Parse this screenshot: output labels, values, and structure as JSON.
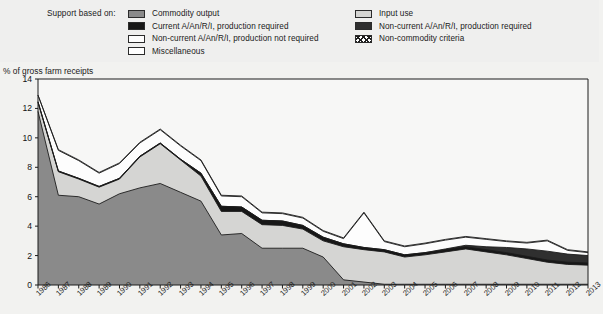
{
  "legend": {
    "title": "Support based on:",
    "items": [
      {
        "label": "Commodity output",
        "swatch": "sw-commodity",
        "icon": "legend-swatch-commodity-output",
        "col": 0,
        "row": 0
      },
      {
        "label": "Current A/An/R/I, production required",
        "swatch": "sw-current-anri",
        "icon": "legend-swatch-current-anri",
        "col": 0,
        "row": 1
      },
      {
        "label": "Non-current A/An/R/I, production not required",
        "swatch": "sw-noncurrent-notreq",
        "icon": "legend-swatch-noncurrent-not-required",
        "col": 0,
        "row": 2
      },
      {
        "label": "Miscellaneous",
        "swatch": "sw-misc",
        "icon": "legend-swatch-miscellaneous",
        "col": 0,
        "row": 3
      },
      {
        "label": "Input use",
        "swatch": "sw-inputuse",
        "icon": "legend-swatch-input-use",
        "col": 1,
        "row": 0
      },
      {
        "label": "Non-current A/An/R/I, production required",
        "swatch": "sw-noncurrent-req",
        "icon": "legend-swatch-noncurrent-required",
        "col": 1,
        "row": 1
      },
      {
        "label": "Non-commodity criteria",
        "swatch": "sw-noncommodity",
        "icon": "legend-swatch-non-commodity-criteria",
        "col": 1,
        "row": 2
      }
    ]
  },
  "axis": {
    "y_title": "% of gross farm receipts",
    "y_ticks": [
      "0",
      "2",
      "4",
      "6",
      "8",
      "10",
      "12",
      "14"
    ]
  },
  "colors": {
    "commodity_output": "#8a8a8a",
    "input_use": "#d5d5d3",
    "current_anri": "#171717",
    "noncurrent_required": "#2f2f2f",
    "noncurrent_not_required": "#fdfdfd",
    "miscellaneous": "#ffffff",
    "non_commodity": "#ffffff",
    "outline": "#1c1c1c",
    "plot_background": "#f7f7f6",
    "page_background": "#f2f2f0"
  },
  "chart_data": {
    "type": "area",
    "stacked": true,
    "title": "",
    "xlabel": "",
    "ylabel": "% of gross farm receipts",
    "ylim": [
      0,
      14
    ],
    "ytick_step": 2,
    "grid": false,
    "legend_position": "top",
    "categories": [
      "1986",
      "1987",
      "1988",
      "1989",
      "1990",
      "1991",
      "1992",
      "1993",
      "1994",
      "1995",
      "1996",
      "1997",
      "1998",
      "1999",
      "2000",
      "2001",
      "2002",
      "2003",
      "2004",
      "2005",
      "2006",
      "2007",
      "2008",
      "2009",
      "2010",
      "2011",
      "2012",
      "2013"
    ],
    "series": [
      {
        "name": "Commodity output",
        "color": "#8a8a8a",
        "values": [
          11.8,
          6.1,
          6.0,
          5.5,
          6.2,
          6.6,
          6.9,
          6.3,
          5.7,
          3.4,
          3.5,
          2.5,
          2.5,
          2.5,
          1.9,
          0.35,
          0.2,
          0.05,
          0.05,
          0.05,
          0.05,
          0.05,
          0.05,
          0.05,
          0.05,
          0.05,
          0.05,
          0.05
        ]
      },
      {
        "name": "Input use",
        "color": "#d5d5d3",
        "values": [
          0.6,
          1.6,
          1.2,
          1.15,
          1.0,
          2.1,
          2.7,
          2.2,
          1.7,
          1.6,
          1.5,
          1.6,
          1.55,
          1.3,
          1.1,
          2.25,
          2.2,
          2.2,
          1.85,
          2.0,
          2.2,
          2.4,
          2.2,
          2.0,
          1.75,
          1.5,
          1.35,
          1.3
        ]
      },
      {
        "name": "Current A/An/R/I, production required",
        "color": "#171717",
        "values": [
          0.05,
          0.05,
          0.05,
          0.05,
          0.05,
          0.05,
          0.05,
          0.05,
          0.2,
          0.35,
          0.3,
          0.3,
          0.3,
          0.25,
          0.25,
          0.2,
          0.15,
          0.15,
          0.15,
          0.15,
          0.15,
          0.15,
          0.15,
          0.15,
          0.15,
          0.15,
          0.15,
          0.15
        ]
      },
      {
        "name": "Non-current A/An/R/I, production required",
        "color": "#2f2f2f",
        "values": [
          0.0,
          0.0,
          0.0,
          0.0,
          0.0,
          0.0,
          0.0,
          0.0,
          0.0,
          0.0,
          0.0,
          0.0,
          0.0,
          0.0,
          0.0,
          0.0,
          0.0,
          0.0,
          0.0,
          0.0,
          0.05,
          0.1,
          0.2,
          0.35,
          0.5,
          0.6,
          0.55,
          0.5
        ]
      },
      {
        "name": "Non-current A/An/R/I, production not required",
        "color": "#fdfdfd",
        "values": [
          0.45,
          1.4,
          1.2,
          0.9,
          1.0,
          0.9,
          0.9,
          0.9,
          0.85,
          0.7,
          0.7,
          0.5,
          0.5,
          0.5,
          0.4,
          0.35,
          2.35,
          0.55,
          0.55,
          0.6,
          0.6,
          0.55,
          0.5,
          0.4,
          0.4,
          0.7,
          0.25,
          0.2
        ]
      },
      {
        "name": "Miscellaneous",
        "color": "#ffffff",
        "values": [
          0.0,
          0.05,
          0.05,
          0.05,
          0.05,
          0.05,
          0.05,
          0.05,
          0.05,
          0.05,
          0.05,
          0.05,
          0.05,
          0.05,
          0.05,
          0.05,
          0.05,
          0.05,
          0.05,
          0.05,
          0.05,
          0.05,
          0.05,
          0.05,
          0.05,
          0.05,
          0.05,
          0.05
        ]
      }
    ],
    "totals": [
      12.9,
      9.2,
      8.5,
      7.65,
      8.3,
      9.7,
      10.6,
      9.5,
      8.5,
      6.1,
      6.05,
      4.95,
      4.9,
      4.6,
      3.7,
      3.2,
      4.95,
      3.0,
      2.65,
      2.85,
      3.05,
      3.25,
      3.1,
      2.95,
      2.85,
      3.0,
      2.35,
      2.2
    ]
  }
}
